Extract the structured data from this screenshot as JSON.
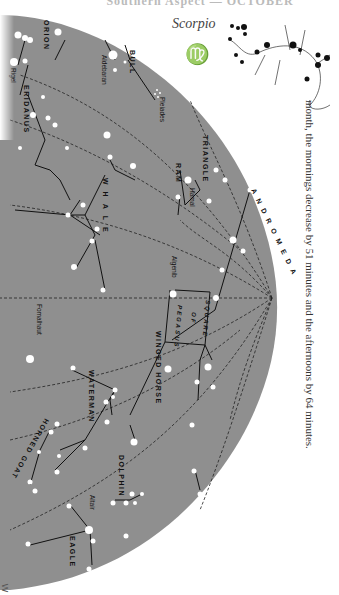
{
  "page": {
    "title": "Southern Aspect — OCTOBER",
    "body_text": "month, the mornings decrease by 51 minutes and the afternoons by 64 minutes.",
    "bottom_mark": "W"
  },
  "zodiac": {
    "constellation_name": "Scorpio",
    "sign_symbol": "♍"
  },
  "colors": {
    "sky": "#8f8f8f",
    "star": "#ffffff",
    "line": "#111111",
    "page": "#ffffff"
  },
  "constellations": [
    {
      "name": "ORION"
    },
    {
      "name": "Rigel"
    },
    {
      "name": "ERIDANUS"
    },
    {
      "name": "BULL"
    },
    {
      "name": "Aldebaran"
    },
    {
      "name": "Pleiades"
    },
    {
      "name": "WHALE"
    },
    {
      "name": "TRIANGLE"
    },
    {
      "name": "RAM"
    },
    {
      "name": "Hamal"
    },
    {
      "name": "ANDROMEDA"
    },
    {
      "name": "Algenib"
    },
    {
      "name": "SQUARE"
    },
    {
      "name": "OF"
    },
    {
      "name": "PEGASUS"
    },
    {
      "name": "WINGED HORSE"
    },
    {
      "name": "Fomalhaut"
    },
    {
      "name": "WATERMAN"
    },
    {
      "name": "HORNED GOAT"
    },
    {
      "name": "DOLPHIN"
    },
    {
      "name": "Altair"
    },
    {
      "name": "EAGLE"
    }
  ]
}
